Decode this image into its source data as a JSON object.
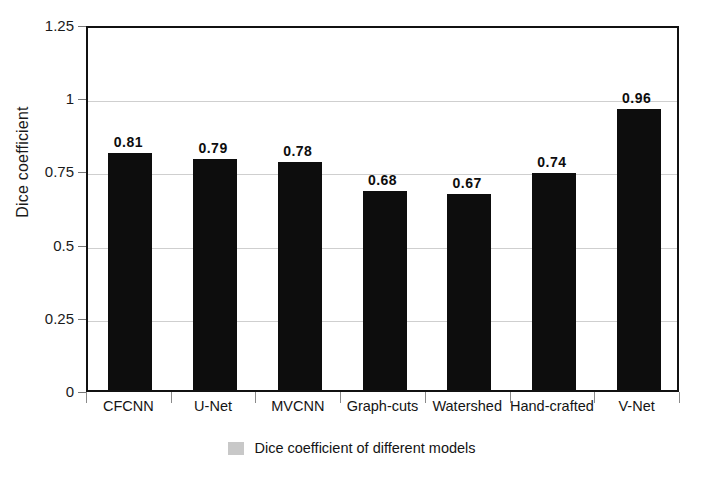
{
  "chart_data": {
    "type": "bar",
    "title": "",
    "xlabel": "",
    "ylabel": "Dice coefficient",
    "ylim": [
      0,
      1.25
    ],
    "yticks": [
      "0",
      "0.25",
      "0.5",
      "0.75",
      "1",
      "1.25"
    ],
    "ytick_values": [
      0,
      0.25,
      0.5,
      0.75,
      1,
      1.25
    ],
    "grid": true,
    "legend_position": "bottom-center",
    "bar_color": "#0d0d0d",
    "legend_swatch_color": "#c8c8c8",
    "categories": [
      "CFCNN",
      "U-Net",
      "MVCNN",
      "Graph-cuts",
      "Watershed",
      "Hand-crafted",
      "V-Net"
    ],
    "values": [
      0.81,
      0.79,
      0.78,
      0.68,
      0.67,
      0.74,
      0.96
    ],
    "bar_labels": [
      "0.81",
      "0.79",
      "0.78",
      "0.68",
      "0.67",
      "0.74",
      "0.96"
    ],
    "series": [
      {
        "name": "Dice coefficient of different models",
        "values": [
          0.81,
          0.79,
          0.78,
          0.68,
          0.67,
          0.74,
          0.96
        ]
      }
    ],
    "legend": [
      "Dice coefficient of different models"
    ]
  },
  "axis": {
    "y_title": "Dice coefficient"
  },
  "legend": {
    "label": "Dice coefficient of different models"
  }
}
